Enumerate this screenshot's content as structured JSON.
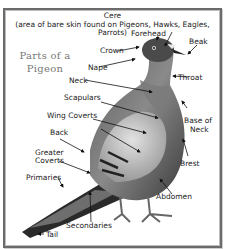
{
  "diagram": {
    "title_line1": "Parts of a",
    "title_line2": "Pigeon",
    "cere": {
      "label": "Cere",
      "note": "(area of bare skin found on Pigeons, Hawks, Eagles, Parrots)"
    },
    "labels": {
      "forehead": "Forehead",
      "beak": "Beak",
      "crown": "Crown",
      "nape": "Nape",
      "throat": "Throat",
      "neck": "Neck",
      "scapulars": "Scapulars",
      "base_of_neck_1": "Base of",
      "base_of_neck_2": "Neck",
      "wing_coverts": "Wing Coverts",
      "back": "Back",
      "greater_coverts_1": "Greater",
      "greater_coverts_2": "Coverts",
      "brest": "Brest",
      "primaries": "Primaries",
      "abdomen": "Abdomen",
      "secondaries": "Secondaries",
      "tail": "Tail"
    },
    "colors": {
      "frame": "#6b6b6b",
      "title": "#777777",
      "text": "#222222"
    }
  }
}
